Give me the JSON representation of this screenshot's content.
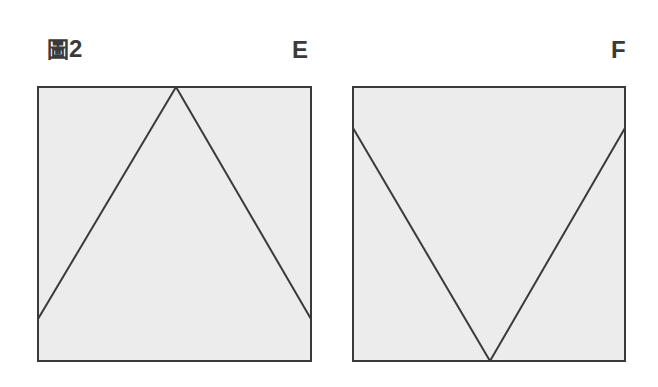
{
  "figure": {
    "title_glyph": "圖",
    "title_number": "2"
  },
  "panels": [
    {
      "label": "E",
      "box": {
        "x": 38,
        "y": 87,
        "w": 273,
        "h": 274
      },
      "lines": [
        {
          "x1": 38,
          "y1": 319,
          "x2": 176,
          "y2": 87
        },
        {
          "x1": 176,
          "y1": 87,
          "x2": 311,
          "y2": 319
        }
      ]
    },
    {
      "label": "F",
      "box": {
        "x": 353,
        "y": 87,
        "w": 272,
        "h": 274
      },
      "lines": [
        {
          "x1": 353,
          "y1": 128,
          "x2": 490,
          "y2": 361
        },
        {
          "x1": 490,
          "y1": 361,
          "x2": 625,
          "y2": 128
        }
      ]
    }
  ],
  "colors": {
    "stroke": "#3a3a3a",
    "fill": "#ececec",
    "background": "#ffffff"
  }
}
